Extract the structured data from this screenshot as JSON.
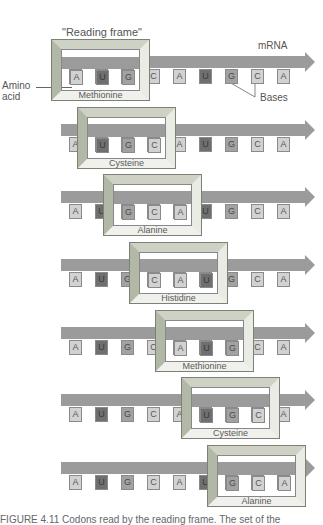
{
  "labels": {
    "reading_frame": "\"Reading frame\"",
    "mrna": "mRNA",
    "amino_acid": "Amino\nacid",
    "amino_line1": "Amino",
    "amino_line2": "acid",
    "bases": "Bases"
  },
  "sequence": [
    "A",
    "U",
    "G",
    "C",
    "A",
    "U",
    "G",
    "C",
    "A"
  ],
  "rows": [
    {
      "frame_start": 0,
      "amino_acid": "Methionine"
    },
    {
      "frame_start": 1,
      "amino_acid": "Cysteine"
    },
    {
      "frame_start": 2,
      "amino_acid": "Alanine"
    },
    {
      "frame_start": 3,
      "amino_acid": "Histidine"
    },
    {
      "frame_start": 4,
      "amino_acid": "Methionine"
    },
    {
      "frame_start": 5,
      "amino_acid": "Cysteine"
    },
    {
      "frame_start": 6,
      "amino_acid": "Alanine"
    }
  ],
  "caption": "FIGURE 4.11  Codons read by the reading frame. The set of the",
  "colors": {
    "bar": "#9b9b9b",
    "base_light": "#d2d2d2",
    "base_U": "#6f6f6f",
    "base_G": "#a2a2a2",
    "frame_bevel": "#cdd2c4"
  }
}
